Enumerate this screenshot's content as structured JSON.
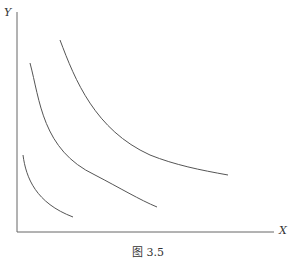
{
  "diagram": {
    "y_axis_label": "Y",
    "x_axis_label": "X",
    "caption": "图 3.5",
    "curves": [
      {
        "name": "indifference-curve-1",
        "path": "M23,155 C26,178 36,203 73,217"
      },
      {
        "name": "indifference-curve-2",
        "path": "M30,63 C40,100 42,150 95,175 C120,188 140,200 157,207"
      },
      {
        "name": "indifference-curve-3",
        "path": "M60,40 C75,80 95,130 150,155 C175,165 200,170 228,175"
      }
    ],
    "stroke_color": "#555555"
  }
}
